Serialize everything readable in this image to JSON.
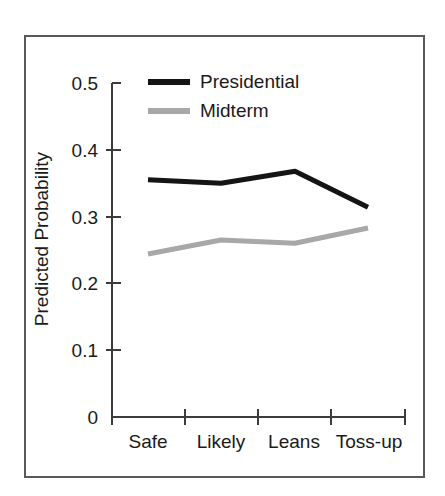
{
  "chart_data": {
    "type": "line",
    "title": "",
    "subtitle": "",
    "xlabel": "",
    "ylabel": "Predicted Probability",
    "categories": [
      "Safe",
      "Likely",
      "Leans",
      "Toss-up"
    ],
    "xtick_labels": [
      "Safe",
      "Likely",
      "Leans",
      "Toss-up"
    ],
    "ytick_labels": [
      "0.5",
      "0.4",
      "0.3",
      "0.2",
      "0.1",
      "0"
    ],
    "ytick_values": [
      0.5,
      0.4,
      0.3,
      0.2,
      0.1,
      0
    ],
    "ylim": [
      0,
      0.5
    ],
    "grid": false,
    "legend_position": "top-center",
    "series": [
      {
        "name": "Presidential",
        "color": "#141414",
        "values": [
          0.355,
          0.35,
          0.368,
          0.314
        ]
      },
      {
        "name": "Midterm",
        "color": "#a8a8a8",
        "values": [
          0.244,
          0.265,
          0.26,
          0.283
        ]
      }
    ]
  },
  "axes": {
    "y_label": "Predicted Probability",
    "y_ticks": [
      {
        "label": "0.5"
      },
      {
        "label": "0.4"
      },
      {
        "label": "0.3"
      },
      {
        "label": "0.2"
      },
      {
        "label": "0.1"
      },
      {
        "label": "0"
      }
    ],
    "x_ticks": [
      {
        "label": "Safe"
      },
      {
        "label": "Likely"
      },
      {
        "label": "Leans"
      },
      {
        "label": "Toss-up"
      }
    ]
  },
  "legend": {
    "entries": [
      {
        "label": "Presidential",
        "color": "#141414"
      },
      {
        "label": "Midterm",
        "color": "#a8a8a8"
      }
    ]
  },
  "style": {
    "background": "#ffffff",
    "frame_color": "#595959",
    "axis_color": "#3c3c3c",
    "text_color": "#1a1a1a"
  }
}
